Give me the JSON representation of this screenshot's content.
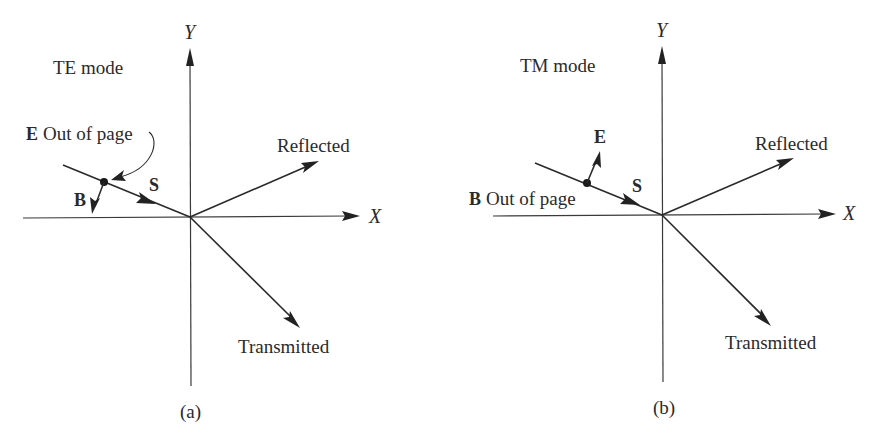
{
  "figure": {
    "panels": [
      {
        "id": "a",
        "mode_label": "TE mode",
        "caption": "(a)",
        "axes": {
          "x_label": "X",
          "y_label": "Y"
        },
        "vectors": {
          "poynting": "S",
          "field_in_plane": "B",
          "field_out_of_page_symbol": "E",
          "field_out_of_page_text": "Out of page"
        },
        "rays": {
          "reflected": "Reflected",
          "transmitted": "Transmitted"
        }
      },
      {
        "id": "b",
        "mode_label": "TM mode",
        "caption": "(b)",
        "axes": {
          "x_label": "X",
          "y_label": "Y"
        },
        "vectors": {
          "poynting": "S",
          "field_in_plane": "E",
          "field_out_of_page_symbol": "B",
          "field_out_of_page_text": "Out of page"
        },
        "rays": {
          "reflected": "Reflected",
          "transmitted": "Transmitted"
        }
      }
    ],
    "colors": {
      "background": "#ffffff",
      "ink": "#2a2a2a"
    }
  }
}
